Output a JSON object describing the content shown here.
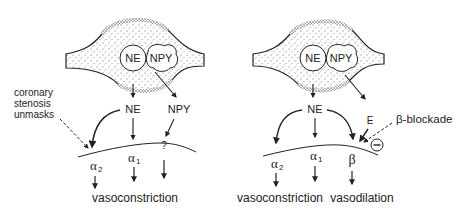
{
  "colors": {
    "ink": "#222222",
    "stipple": "#555555",
    "background": "#ffffff"
  },
  "left_panel": {
    "vesicles": {
      "ne": "NE",
      "npy": "NPY"
    },
    "released": {
      "ne": "NE",
      "npy": "NPY"
    },
    "annotation": {
      "line1": "coronary",
      "line2": "stenosis",
      "line3": "unmasks"
    },
    "receptors": {
      "alpha2": "α2",
      "alpha1": "α1",
      "unknown": "?"
    },
    "receptor_subscripts": {
      "alpha2_base": "α",
      "alpha2_sub": "2",
      "alpha1_base": "α",
      "alpha1_sub": "1"
    },
    "outcome": "vasoconstriction"
  },
  "right_panel": {
    "vesicles": {
      "ne": "NE",
      "npy": "NPY"
    },
    "released": {
      "ne": "NE",
      "e": "E"
    },
    "annotation": "β-blockade",
    "inhibition_symbol": "−",
    "receptors": {
      "alpha2": "α2",
      "alpha1": "α1",
      "beta": "β"
    },
    "receptor_subscripts": {
      "alpha2_base": "α",
      "alpha2_sub": "2",
      "alpha1_base": "α",
      "alpha1_sub": "1"
    },
    "outcomes": {
      "constriction": "vasoconstriction",
      "dilation": "vasodilation"
    }
  }
}
